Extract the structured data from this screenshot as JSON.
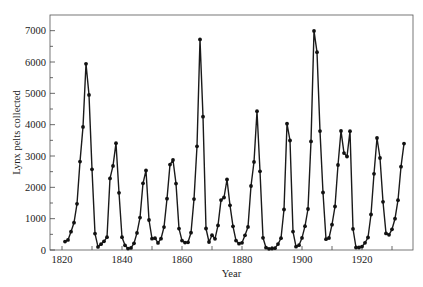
{
  "chart_data": {
    "type": "line",
    "title": "",
    "xlabel": "Year",
    "ylabel": "Lynx pelts collected",
    "xlim": [
      1816,
      1937
    ],
    "ylim": [
      0,
      7500
    ],
    "x_ticks": [
      1820,
      1830,
      1840,
      1850,
      1860,
      1870,
      1880,
      1890,
      1900,
      1910,
      1920,
      1930
    ],
    "x_tick_labels": [
      "1820",
      "",
      "1840",
      "",
      "1860",
      "",
      "1880",
      "",
      "1900",
      "",
      "1920",
      ""
    ],
    "y_ticks": [
      0,
      500,
      1000,
      1500,
      2000,
      2500,
      3000,
      3500,
      4000,
      4500,
      5000,
      5500,
      6000,
      6500,
      7000
    ],
    "y_tick_labels": [
      "0",
      "",
      "1000",
      "",
      "2000",
      "",
      "3000",
      "",
      "4000",
      "",
      "5000",
      "",
      "6000",
      "",
      "7000"
    ],
    "grid": false,
    "legend": null,
    "marker": "circle",
    "line_color": "#1a1a1a",
    "x_start": 1821,
    "x_end": 1934,
    "series": [
      {
        "name": "Lynx pelts collected",
        "values": [
          269,
          321,
          585,
          871,
          1475,
          2821,
          3928,
          5943,
          4950,
          2577,
          523,
          98,
          184,
          279,
          409,
          2285,
          2685,
          3409,
          1824,
          409,
          151,
          45,
          68,
          213,
          546,
          1033,
          2129,
          2536,
          957,
          361,
          377,
          225,
          360,
          731,
          1638,
          2725,
          2871,
          2119,
          684,
          299,
          236,
          245,
          552,
          1623,
          3311,
          6721,
          4254,
          687,
          255,
          473,
          358,
          784,
          1594,
          1676,
          2251,
          1426,
          756,
          299,
          201,
          229,
          469,
          736,
          2042,
          2811,
          4431,
          2511,
          389,
          73,
          39,
          49,
          59,
          188,
          377,
          1292,
          4031,
          3495,
          587,
          105,
          153,
          387,
          758,
          1307,
          3465,
          6991,
          6313,
          3794,
          1836,
          345,
          382,
          808,
          1388,
          2713,
          3800,
          3091,
          2985,
          3790,
          674,
          81,
          80,
          108,
          229,
          399,
          1132,
          2432,
          3574,
          2935,
          1537,
          529,
          485,
          662,
          1000,
          1590,
          2657,
          3396
        ]
      }
    ]
  },
  "plot_area": {
    "left": 50,
    "right": 413,
    "top": 15,
    "bottom": 250
  }
}
